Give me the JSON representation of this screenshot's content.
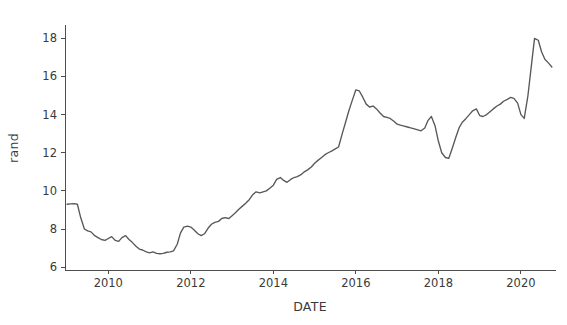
{
  "chart_data": {
    "type": "line",
    "title": "",
    "xlabel": "DATE",
    "ylabel": "rand",
    "xlim": [
      2008.95,
      2020.85
    ],
    "ylim": [
      5.85,
      18.7
    ],
    "grid": false,
    "legend": false,
    "legend_position": "none",
    "xticks": [
      2010,
      2012,
      2014,
      2016,
      2018,
      2020
    ],
    "xtick_labels": [
      "2010",
      "2012",
      "2014",
      "2016",
      "2018",
      "2020"
    ],
    "yticks": [
      6,
      8,
      10,
      12,
      14,
      16,
      18
    ],
    "ytick_labels": [
      "6",
      "8",
      "10",
      "12",
      "14",
      "16",
      "18"
    ],
    "line_color": "#585858",
    "series": [
      {
        "name": "rand",
        "x": [
          2009.0,
          2009.08,
          2009.17,
          2009.25,
          2009.33,
          2009.42,
          2009.5,
          2009.58,
          2009.67,
          2009.75,
          2009.83,
          2009.92,
          2010.0,
          2010.08,
          2010.17,
          2010.25,
          2010.33,
          2010.42,
          2010.5,
          2010.58,
          2010.67,
          2010.75,
          2010.83,
          2010.92,
          2011.0,
          2011.08,
          2011.17,
          2011.25,
          2011.33,
          2011.42,
          2011.5,
          2011.58,
          2011.67,
          2011.75,
          2011.83,
          2011.92,
          2012.0,
          2012.08,
          2012.17,
          2012.25,
          2012.33,
          2012.42,
          2012.5,
          2012.58,
          2012.67,
          2012.75,
          2012.83,
          2012.92,
          2013.0,
          2013.08,
          2013.17,
          2013.25,
          2013.33,
          2013.42,
          2013.5,
          2013.58,
          2013.67,
          2013.75,
          2013.83,
          2013.92,
          2014.0,
          2014.08,
          2014.17,
          2014.25,
          2014.33,
          2014.42,
          2014.5,
          2014.58,
          2014.67,
          2014.75,
          2014.83,
          2014.92,
          2015.0,
          2015.08,
          2015.17,
          2015.25,
          2015.33,
          2015.42,
          2015.5,
          2015.58,
          2015.67,
          2015.75,
          2015.83,
          2015.92,
          2016.0,
          2016.08,
          2016.17,
          2016.25,
          2016.33,
          2016.42,
          2016.5,
          2016.58,
          2016.67,
          2016.75,
          2016.83,
          2016.92,
          2017.0,
          2017.08,
          2017.17,
          2017.25,
          2017.33,
          2017.42,
          2017.5,
          2017.58,
          2017.67,
          2017.75,
          2017.83,
          2017.92,
          2018.0,
          2018.08,
          2018.17,
          2018.25,
          2018.33,
          2018.42,
          2018.5,
          2018.58,
          2018.67,
          2018.75,
          2018.83,
          2018.92,
          2019.0,
          2019.08,
          2019.17,
          2019.25,
          2019.33,
          2019.42,
          2019.5,
          2019.58,
          2019.67,
          2019.75,
          2019.83,
          2019.92,
          2020.0,
          2020.08,
          2020.17,
          2020.25,
          2020.33,
          2020.42,
          2020.5,
          2020.58,
          2020.67,
          2020.75
        ],
        "values": [
          9.3,
          9.32,
          9.33,
          9.3,
          8.6,
          8.0,
          7.9,
          7.85,
          7.65,
          7.55,
          7.45,
          7.4,
          7.5,
          7.6,
          7.4,
          7.35,
          7.55,
          7.65,
          7.45,
          7.3,
          7.1,
          6.95,
          6.9,
          6.8,
          6.75,
          6.8,
          6.72,
          6.7,
          6.72,
          6.78,
          6.8,
          6.85,
          7.2,
          7.8,
          8.1,
          8.15,
          8.1,
          7.95,
          7.75,
          7.65,
          7.75,
          8.05,
          8.25,
          8.35,
          8.4,
          8.55,
          8.6,
          8.55,
          8.7,
          8.85,
          9.05,
          9.2,
          9.35,
          9.55,
          9.8,
          9.95,
          9.9,
          9.95,
          10.0,
          10.15,
          10.3,
          10.6,
          10.7,
          10.55,
          10.45,
          10.6,
          10.7,
          10.75,
          10.85,
          11.0,
          11.1,
          11.25,
          11.45,
          11.6,
          11.75,
          11.9,
          12.0,
          12.1,
          12.2,
          12.3,
          13.0,
          13.6,
          14.2,
          14.8,
          15.3,
          15.25,
          14.9,
          14.55,
          14.4,
          14.45,
          14.3,
          14.1,
          13.9,
          13.85,
          13.8,
          13.65,
          13.5,
          13.45,
          13.4,
          13.35,
          13.3,
          13.25,
          13.2,
          13.15,
          13.3,
          13.7,
          13.9,
          13.4,
          12.6,
          12.0,
          11.75,
          11.7,
          12.2,
          12.8,
          13.3,
          13.6,
          13.8,
          14.0,
          14.2,
          14.3,
          13.95,
          13.9,
          14.0,
          14.15,
          14.3,
          14.45,
          14.55,
          14.7,
          14.8,
          14.9,
          14.85,
          14.6,
          14.0,
          13.8,
          15.0,
          16.5,
          18.0,
          17.9,
          17.3,
          16.9,
          16.7,
          16.5
        ]
      }
    ]
  },
  "figure": {
    "axis_color": "#4d4d4d",
    "background": "#ffffff"
  }
}
